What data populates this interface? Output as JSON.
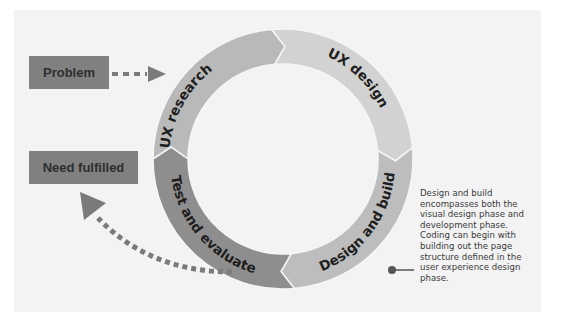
{
  "boxes": {
    "problem": "Problem",
    "need_fulfilled": "Need fulfilled"
  },
  "cycle": {
    "segments": [
      {
        "label": "UX research",
        "color": "#b9b9b9"
      },
      {
        "label": "UX design",
        "color": "#d2d2d2"
      },
      {
        "label": "Design and build",
        "color": "#bdbdbd"
      },
      {
        "label": "Test and evaluate",
        "color": "#8e8e8e"
      }
    ]
  },
  "note": {
    "text": "Design and build\nencompasses both the\nvisual design phase and\ndevelopment phase.\nCoding can begin with\nbuilding out the page\nstructure defined in the\nuser experience design\nphase."
  },
  "colors": {
    "box": "#808080",
    "arrow": "#7a7a7a",
    "panel": "#f3f3f3",
    "connector": "#555555"
  }
}
